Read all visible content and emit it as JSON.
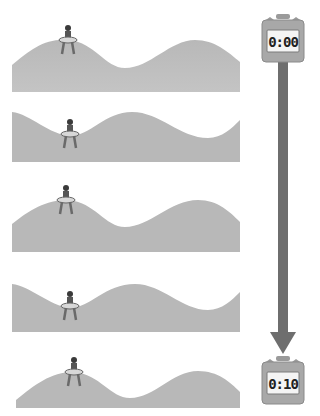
{
  "diagram": {
    "panels": [
      {
        "index": 1,
        "wave_phase": "crest",
        "swimmer_position": "on crest"
      },
      {
        "index": 2,
        "wave_phase": "trough",
        "swimmer_position": "in trough"
      },
      {
        "index": 3,
        "wave_phase": "crest",
        "swimmer_position": "on crest"
      },
      {
        "index": 4,
        "wave_phase": "trough",
        "swimmer_position": "in trough"
      },
      {
        "index": 5,
        "wave_phase": "crest",
        "swimmer_position": "on crest"
      }
    ],
    "timer_start": {
      "label": "0:00"
    },
    "timer_end": {
      "label": "0:10"
    },
    "arrow": {
      "direction": "down",
      "meaning": "time passing"
    },
    "colors": {
      "wave": "#b4b4b4",
      "arrow": "#6e6e6e",
      "timer_body": "#a8a8a8",
      "timer_screen": "#f4f4f4"
    }
  }
}
